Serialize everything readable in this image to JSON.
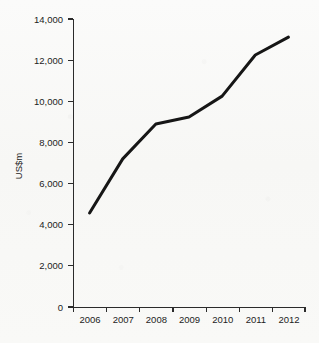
{
  "chart_data": {
    "type": "line",
    "title": "",
    "subtitle": "",
    "xlabel": "",
    "ylabel": "US$m",
    "categories": [
      "2006",
      "2007",
      "2008",
      "2009",
      "2010",
      "2011",
      "2012"
    ],
    "values": [
      4570,
      7200,
      8900,
      9240,
      10250,
      12250,
      13120
    ],
    "series": [
      {
        "name": "US$m",
        "values": [
          4570,
          7200,
          8900,
          9240,
          10250,
          12250,
          13120
        ]
      }
    ],
    "ylim": [
      0,
      14000
    ],
    "ytick_step": 2000,
    "ytick_labels": [
      "0",
      "2,000",
      "4,000",
      "6,000",
      "8,000",
      "10,000",
      "12,000",
      "14,000"
    ],
    "ytick_values": [
      0,
      2000,
      4000,
      6000,
      8000,
      10000,
      12000,
      14000
    ],
    "xtick_labels": [
      "2006",
      "2007",
      "2008",
      "2009",
      "2010",
      "2011",
      "2012"
    ],
    "grid": false,
    "legend": false,
    "legend_position": "none",
    "line_color": "#161616",
    "axis_color": "#2b2b2b",
    "background_color": "#f7f7f5",
    "annotations": []
  }
}
